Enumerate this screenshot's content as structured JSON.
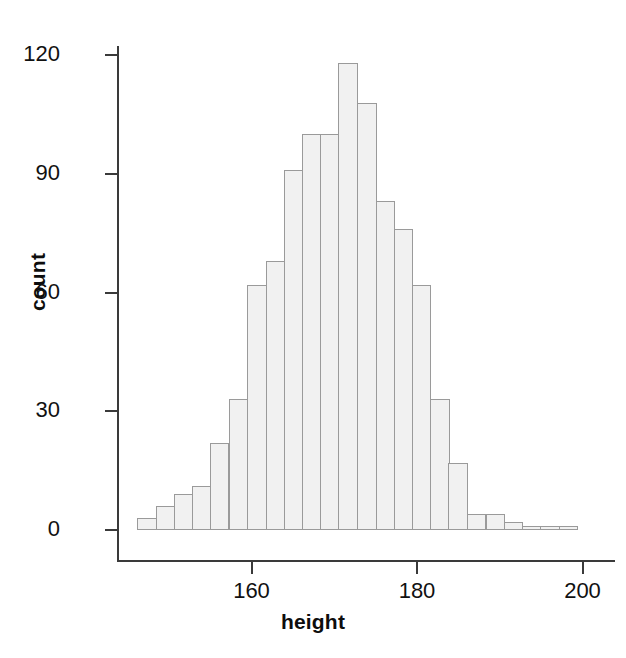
{
  "chart_data": {
    "type": "bar",
    "title": "",
    "xlabel": "height",
    "ylabel": "count",
    "xlim": [
      146.2,
      199.6
    ],
    "ylim": [
      0,
      124
    ],
    "grid": false,
    "legend": null,
    "bin_width": 2.22,
    "xticks": [
      160,
      180,
      200
    ],
    "xtick_labels": [
      "160",
      "180",
      "200"
    ],
    "yticks": [
      0,
      30,
      60,
      90,
      120
    ],
    "ytick_labels": [
      "0",
      "30",
      "60",
      "90",
      "120"
    ],
    "bin_starts": [
      146.2,
      148.4,
      150.6,
      152.8,
      155.0,
      157.3,
      159.5,
      161.7,
      163.9,
      166.1,
      168.3,
      170.5,
      172.8,
      175.0,
      177.2,
      179.4,
      181.6,
      183.8,
      186.0,
      188.3,
      190.5,
      192.7,
      194.9,
      197.1
    ],
    "bin_centers": [
      147.3,
      149.5,
      151.7,
      153.9,
      156.1,
      158.4,
      160.6,
      162.8,
      165.0,
      167.2,
      169.4,
      171.6,
      173.9,
      176.1,
      178.3,
      180.5,
      182.7,
      184.9,
      187.1,
      189.4,
      191.6,
      193.8,
      196.0,
      198.2
    ],
    "values": [
      3,
      6,
      9,
      11,
      22,
      33,
      62,
      68,
      91,
      100,
      100,
      118,
      108,
      83,
      76,
      62,
      33,
      17,
      4,
      4,
      2,
      1,
      1,
      1
    ],
    "bar_fill": "#f1f1f1",
    "bar_border": "#9a9a9a"
  },
  "axes": {
    "x_label": "height",
    "y_label": "count"
  }
}
